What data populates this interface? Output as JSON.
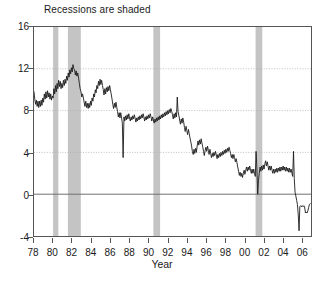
{
  "chart": {
    "title": "Recessions are shaded",
    "xlabel": "Year",
    "ylabel": ""
  },
  "axes": {
    "y_ticks": [
      "16",
      "12",
      "8",
      "4",
      "0",
      "-4"
    ],
    "x_ticks": [
      "78",
      "80",
      "82",
      "84",
      "86",
      "88",
      "90",
      "92",
      "94",
      "96",
      "98",
      "00",
      "02",
      "04",
      "06"
    ]
  },
  "colors": {
    "line": "#1a1a1a",
    "shade": "#c4c4c4",
    "grid": "#b0b0b0",
    "zero_line": "#6e6e6e",
    "frame": "#555555"
  },
  "chart_data": {
    "type": "line",
    "title": "Recessions are shaded",
    "xlabel": "Year",
    "ylabel": "",
    "xlim": [
      1978.0,
      2007.0
    ],
    "ylim": [
      -4,
      16
    ],
    "grid": true,
    "legend": null,
    "x_tick_values": [
      1978,
      1980,
      1982,
      1984,
      1986,
      1988,
      1990,
      1992,
      1994,
      1996,
      1998,
      2000,
      2002,
      2004,
      2006
    ],
    "y_tick_values": [
      -4,
      0,
      4,
      8,
      12,
      16
    ],
    "zero_line": 0,
    "annotations": [
      {
        "text": "Recessions are shaded",
        "position": "above-plot-left"
      }
    ],
    "shaded_regions": [
      {
        "label": "1980 recession",
        "x0": 1980.0,
        "x1": 1980.55
      },
      {
        "label": "1981-82 recession",
        "x0": 1981.55,
        "x1": 1982.9
      },
      {
        "label": "1990-91 recession",
        "x0": 1990.5,
        "x1": 1991.2
      },
      {
        "label": "2001 recession",
        "x0": 2001.2,
        "x1": 2001.9
      }
    ],
    "series": [
      {
        "name": "series-1",
        "x": [
          1978.0,
          1978.08,
          1978.17,
          1978.25,
          1978.33,
          1978.42,
          1978.5,
          1978.58,
          1978.67,
          1978.75,
          1978.83,
          1978.92,
          1979.0,
          1979.08,
          1979.17,
          1979.25,
          1979.33,
          1979.42,
          1979.5,
          1979.58,
          1979.67,
          1979.75,
          1979.83,
          1979.92,
          1980.0,
          1980.08,
          1980.17,
          1980.25,
          1980.33,
          1980.42,
          1980.5,
          1980.58,
          1980.67,
          1980.75,
          1980.83,
          1980.92,
          1981.0,
          1981.08,
          1981.17,
          1981.25,
          1981.33,
          1981.42,
          1981.5,
          1981.58,
          1981.67,
          1981.75,
          1981.83,
          1981.92,
          1982.0,
          1982.08,
          1982.17,
          1982.25,
          1982.33,
          1982.42,
          1982.5,
          1982.58,
          1982.67,
          1982.75,
          1982.83,
          1982.92,
          1983.0,
          1983.08,
          1983.17,
          1983.25,
          1983.33,
          1983.42,
          1983.5,
          1983.58,
          1983.67,
          1983.75,
          1983.83,
          1983.92,
          1984.0,
          1984.08,
          1984.17,
          1984.25,
          1984.33,
          1984.42,
          1984.5,
          1984.58,
          1984.67,
          1984.75,
          1984.83,
          1984.92,
          1985.0,
          1985.08,
          1985.17,
          1985.25,
          1985.33,
          1985.42,
          1985.5,
          1985.58,
          1985.67,
          1985.75,
          1985.83,
          1985.92,
          1986.0,
          1986.08,
          1986.17,
          1986.25,
          1986.33,
          1986.42,
          1986.5,
          1986.58,
          1986.67,
          1986.75,
          1986.83,
          1986.92,
          1987.0,
          1987.08,
          1987.17,
          1987.25,
          1987.33,
          1987.42,
          1987.5,
          1987.58,
          1987.67,
          1987.75,
          1987.83,
          1987.92,
          1988.0,
          1988.08,
          1988.17,
          1988.25,
          1988.33,
          1988.42,
          1988.5,
          1988.58,
          1988.67,
          1988.75,
          1988.83,
          1988.92,
          1989.0,
          1989.08,
          1989.17,
          1989.25,
          1989.33,
          1989.42,
          1989.5,
          1989.58,
          1989.67,
          1989.75,
          1989.83,
          1989.92,
          1990.0,
          1990.08,
          1990.17,
          1990.25,
          1990.33,
          1990.42,
          1990.5,
          1990.58,
          1990.67,
          1990.75,
          1990.83,
          1990.92,
          1991.0,
          1991.08,
          1991.17,
          1991.25,
          1991.33,
          1991.42,
          1991.5,
          1991.58,
          1991.67,
          1991.75,
          1991.83,
          1991.92,
          1992.0,
          1992.08,
          1992.17,
          1992.25,
          1992.33,
          1992.42,
          1992.5,
          1992.58,
          1992.67,
          1992.75,
          1992.83,
          1992.92,
          1993.0,
          1993.08,
          1993.17,
          1993.25,
          1993.33,
          1993.42,
          1993.5,
          1993.58,
          1993.67,
          1993.75,
          1993.83,
          1993.92,
          1994.0,
          1994.08,
          1994.17,
          1994.25,
          1994.33,
          1994.42,
          1994.5,
          1994.58,
          1994.67,
          1994.75,
          1994.83,
          1994.92,
          1995.0,
          1995.08,
          1995.17,
          1995.25,
          1995.33,
          1995.42,
          1995.5,
          1995.58,
          1995.67,
          1995.75,
          1995.83,
          1995.92,
          1996.0,
          1996.08,
          1996.17,
          1996.25,
          1996.33,
          1996.42,
          1996.5,
          1996.58,
          1996.67,
          1996.75,
          1996.83,
          1996.92,
          1997.0,
          1997.08,
          1997.17,
          1997.25,
          1997.33,
          1997.42,
          1997.5,
          1997.58,
          1997.67,
          1997.75,
          1997.83,
          1997.92,
          1998.0,
          1998.08,
          1998.17,
          1998.25,
          1998.33,
          1998.42,
          1998.5,
          1998.58,
          1998.67,
          1998.75,
          1998.83,
          1998.92,
          1999.0,
          1999.08,
          1999.17,
          1999.25,
          1999.33,
          1999.42,
          1999.5,
          1999.58,
          1999.67,
          1999.75,
          1999.83,
          1999.92,
          2000.0,
          2000.08,
          2000.17,
          2000.25,
          2000.33,
          2000.42,
          2000.5,
          2000.58,
          2000.67,
          2000.75,
          2000.83,
          2000.92,
          2001.0,
          2001.08,
          2001.17,
          2001.25,
          2001.33,
          2001.42,
          2001.5,
          2001.58,
          2001.67,
          2001.75,
          2001.83,
          2001.92,
          2002.0,
          2002.08,
          2002.17,
          2002.25,
          2002.33,
          2002.42,
          2002.5,
          2002.58,
          2002.67,
          2002.75,
          2002.83,
          2002.92,
          2003.0,
          2003.08,
          2003.17,
          2003.25,
          2003.33,
          2003.42,
          2003.5,
          2003.58,
          2003.67,
          2003.75,
          2003.83,
          2003.92,
          2004.0,
          2004.08,
          2004.17,
          2004.25,
          2004.33,
          2004.42,
          2004.5,
          2004.58,
          2004.67,
          2004.75,
          2004.83,
          2004.92,
          2005.0,
          2005.08,
          2005.17,
          2005.25,
          2005.33,
          2005.42,
          2005.5,
          2005.58,
          2005.67,
          2005.75,
          2005.83,
          2005.92,
          2006.0,
          2006.08,
          2006.17,
          2006.25,
          2006.33,
          2006.42,
          2006.5,
          2006.58,
          2006.67,
          2006.75,
          2006.83,
          2006.92
        ],
        "y": [
          9.8,
          9.1,
          8.6,
          9.0,
          8.4,
          8.9,
          8.3,
          8.9,
          8.4,
          9.0,
          8.5,
          9.2,
          8.8,
          9.6,
          9.1,
          9.8,
          9.2,
          9.9,
          9.3,
          9.7,
          9.1,
          9.6,
          9.0,
          9.4,
          9.2,
          10.1,
          9.6,
          10.4,
          9.8,
          10.6,
          10.1,
          10.9,
          10.3,
          10.8,
          10.1,
          10.6,
          10.2,
          10.9,
          10.4,
          11.0,
          10.6,
          11.3,
          10.9,
          11.6,
          11.2,
          11.9,
          11.5,
          12.1,
          11.7,
          12.4,
          12.0,
          11.9,
          11.4,
          11.8,
          11.3,
          11.6,
          11.1,
          10.6,
          10.1,
          9.8,
          9.3,
          9.6,
          9.2,
          8.8,
          8.4,
          8.9,
          8.3,
          8.7,
          8.2,
          8.7,
          8.3,
          8.9,
          8.5,
          9.2,
          8.9,
          9.6,
          9.3,
          10.0,
          9.7,
          10.4,
          10.1,
          10.8,
          10.4,
          11.0,
          10.5,
          10.9,
          10.4,
          10.0,
          9.5,
          10.1,
          9.6,
          10.2,
          9.8,
          10.3,
          9.9,
          10.4,
          10.0,
          9.6,
          9.1,
          8.6,
          8.2,
          8.7,
          8.3,
          8.8,
          8.3,
          7.9,
          7.4,
          7.8,
          7.3,
          7.8,
          7.3,
          6.8,
          3.5,
          7.4,
          7.0,
          7.5,
          7.1,
          7.6,
          7.2,
          7.7,
          7.3,
          7.0,
          7.4,
          7.1,
          7.5,
          7.2,
          7.6,
          7.3,
          6.9,
          7.3,
          7.0,
          7.4,
          7.1,
          7.5,
          7.2,
          7.6,
          7.3,
          7.7,
          7.4,
          7.0,
          7.4,
          7.1,
          7.5,
          7.2,
          7.6,
          7.3,
          7.7,
          7.4,
          7.0,
          7.4,
          7.1,
          6.8,
          7.2,
          6.9,
          7.3,
          7.0,
          7.4,
          7.1,
          7.5,
          7.2,
          7.6,
          7.3,
          7.7,
          7.4,
          7.8,
          7.5,
          7.9,
          7.6,
          8.0,
          7.7,
          8.1,
          7.8,
          8.2,
          7.9,
          7.6,
          7.2,
          7.7,
          7.3,
          7.8,
          7.4,
          9.3,
          7.9,
          7.5,
          7.1,
          6.7,
          7.2,
          6.8,
          7.3,
          6.9,
          6.4,
          6.0,
          6.5,
          6.1,
          5.7,
          6.2,
          5.8,
          5.4,
          5.0,
          4.6,
          4.1,
          3.8,
          4.3,
          3.9,
          4.4,
          4.0,
          4.6,
          5.1,
          4.7,
          5.2,
          4.8,
          5.3,
          4.9,
          4.5,
          4.1,
          3.7,
          4.2,
          4.5,
          4.1,
          4.6,
          4.2,
          3.8,
          4.3,
          3.9,
          3.5,
          3.9,
          3.6,
          4.0,
          3.7,
          4.1,
          3.8,
          3.4,
          3.8,
          3.5,
          3.9,
          3.6,
          4.0,
          3.7,
          4.1,
          3.8,
          4.2,
          3.9,
          4.3,
          4.0,
          4.4,
          4.1,
          4.5,
          4.2,
          3.9,
          3.5,
          3.8,
          3.4,
          3.8,
          3.5,
          3.1,
          3.4,
          3.0,
          2.6,
          2.2,
          1.8,
          2.1,
          1.7,
          2.0,
          1.6,
          2.0,
          2.3,
          1.9,
          2.3,
          2.6,
          2.2,
          2.6,
          2.3,
          2.7,
          2.3,
          2.0,
          2.4,
          2.0,
          2.4,
          2.0,
          1.7,
          4.1,
          2.6,
          0.0,
          1.3,
          2.0,
          2.6,
          2.2,
          2.7,
          2.3,
          2.8,
          2.4,
          2.9,
          3.2,
          2.7,
          3.1,
          2.7,
          2.3,
          2.7,
          2.3,
          2.7,
          2.3,
          2.0,
          2.4,
          2.0,
          2.4,
          2.1,
          2.5,
          2.1,
          2.5,
          2.2,
          2.6,
          2.2,
          2.6,
          2.3,
          2.7,
          2.3,
          2.6,
          2.2,
          2.6,
          2.2,
          2.5,
          2.1,
          2.5,
          2.1,
          2.4,
          2.0,
          1.7,
          4.1,
          1.5,
          0.2,
          -0.2,
          -0.6,
          -1.0,
          -2.0,
          -3.5,
          -1.2,
          -1.1,
          -1.2,
          -1.1,
          -1.2,
          -1.1,
          -1.2,
          -1.8,
          -1.7,
          -1.8,
          -1.6,
          -1.3,
          -1.0,
          -0.9
        ]
      }
    ]
  }
}
